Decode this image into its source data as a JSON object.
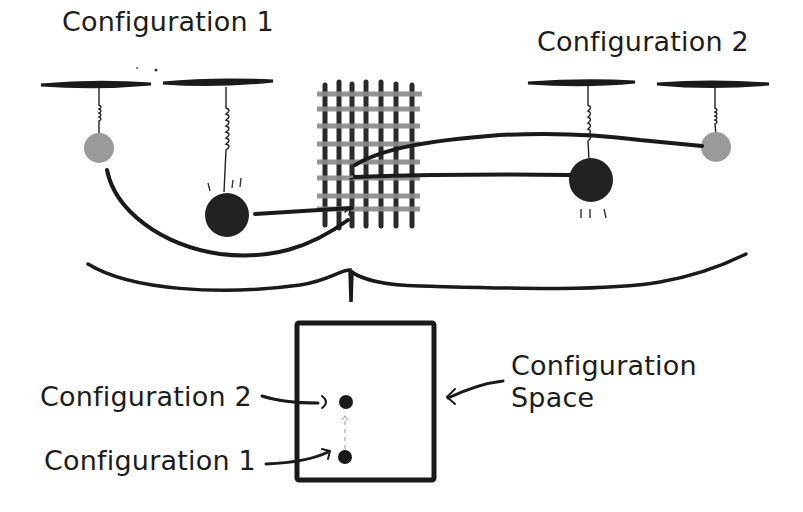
{
  "diagram": {
    "top_labels": {
      "config1": "Configuration 1",
      "config2": "Configuration 2"
    },
    "bottom_labels": {
      "config2": "Configuration 2",
      "config1": "Configuration 1",
      "space_line1": "Configuration",
      "space_line2": "Space"
    },
    "colors": {
      "ink": "#1a1a1a",
      "light_bob": "#9a9a9a",
      "dark_bob": "#222222",
      "grid_horizontal": "#8c8c8c",
      "grid_vertical": "#2a2a2a",
      "dashed_arrow": "#aaaaaa"
    },
    "elements": {
      "pendulum_pairs": 2,
      "grid_vertical_bars": 7,
      "grid_horizontal_bars": 8,
      "space_points": 2
    }
  }
}
